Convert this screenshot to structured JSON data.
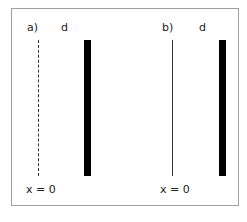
{
  "panels": [
    {
      "id": "a",
      "label": "a)",
      "distance_label": "d",
      "origin_label": "x = 0",
      "line_style": "dashed"
    },
    {
      "id": "b",
      "label": "b)",
      "distance_label": "d",
      "origin_label": "x = 0",
      "line_style": "solid"
    }
  ],
  "colors": {
    "frame": "#a0a0a0",
    "line": "#333333",
    "bar": "#000000"
  }
}
